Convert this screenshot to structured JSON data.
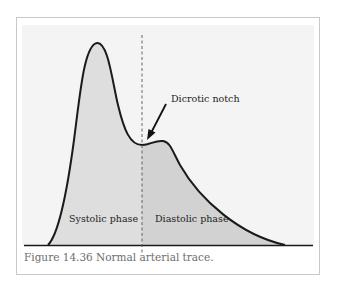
{
  "figure": {
    "caption": "Figure 14.36 Normal arterial trace.",
    "annotation": "Dicrotic notch",
    "phases": {
      "systolic": "Systolic phase",
      "diastolic": "Diastolic phase"
    }
  },
  "colors": {
    "frame_border": "#c9c9c9",
    "plot_background": "#f4f4f4",
    "systolic_fill": "#dedede",
    "diastolic_fill": "#d2d2d2",
    "curve_stroke": "#1a1a1a",
    "caption_text": "#6e6e6e"
  }
}
